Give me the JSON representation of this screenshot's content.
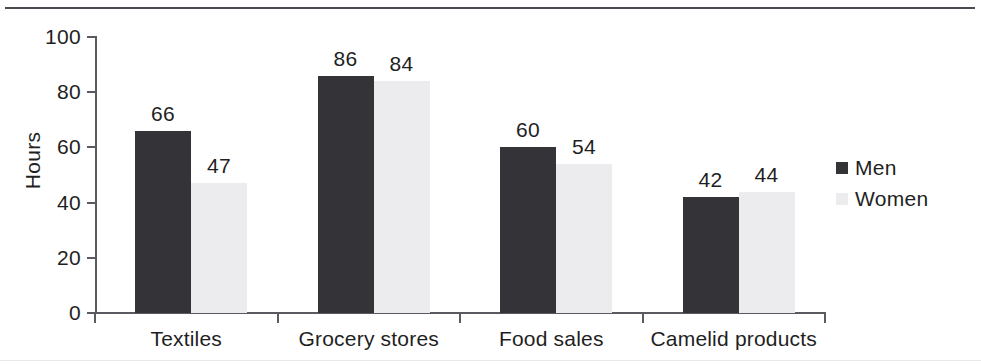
{
  "chart_data": {
    "type": "bar",
    "title": "",
    "xlabel": "",
    "ylabel": "Hours",
    "ylim": [
      0,
      100
    ],
    "yticks": [
      0,
      20,
      40,
      60,
      80,
      100
    ],
    "ytick_labels": [
      "0",
      "20",
      "40",
      "60",
      "80",
      "100"
    ],
    "grid": false,
    "legend_position": "right",
    "categories": [
      "Textiles",
      "Grocery stores",
      "Food sales",
      "Camelid products"
    ],
    "series": [
      {
        "name": "Men",
        "color": "#333338",
        "values": [
          66,
          86,
          60,
          42
        ],
        "value_labels": [
          "66",
          "86",
          "60",
          "42"
        ]
      },
      {
        "name": "Women",
        "color": "#ececee",
        "values": [
          47,
          84,
          54,
          44
        ],
        "value_labels": [
          "47",
          "84",
          "54",
          "44"
        ]
      }
    ]
  },
  "legend": {
    "items": [
      {
        "label": "Men",
        "swatch": "men-swatch-icon"
      },
      {
        "label": "Women",
        "swatch": "women-swatch-icon"
      }
    ]
  }
}
